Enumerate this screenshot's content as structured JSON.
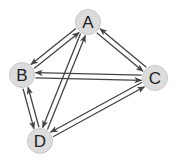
{
  "diagram": {
    "type": "directed-graph",
    "node_fill": "#dcdcdc",
    "node_stroke": "#c8c8c8",
    "edge_color": "#444444",
    "nodes": [
      {
        "id": "A",
        "label": "A",
        "x": 88,
        "y": 22
      },
      {
        "id": "B",
        "label": "B",
        "x": 22,
        "y": 75
      },
      {
        "id": "C",
        "label": "C",
        "x": 155,
        "y": 78
      },
      {
        "id": "D",
        "label": "D",
        "x": 40,
        "y": 141
      }
    ],
    "edges": [
      {
        "from": "B",
        "to": "A"
      },
      {
        "from": "A",
        "to": "B"
      },
      {
        "from": "A",
        "to": "C"
      },
      {
        "from": "C",
        "to": "A"
      },
      {
        "from": "B",
        "to": "C"
      },
      {
        "from": "C",
        "to": "B"
      },
      {
        "from": "A",
        "to": "D"
      },
      {
        "from": "D",
        "to": "A"
      },
      {
        "from": "B",
        "to": "D"
      },
      {
        "from": "D",
        "to": "B"
      },
      {
        "from": "D",
        "to": "C"
      },
      {
        "from": "C",
        "to": "D"
      }
    ]
  }
}
